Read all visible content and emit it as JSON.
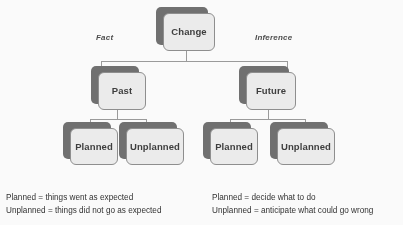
{
  "diagram": {
    "root": {
      "label": "Change"
    },
    "branch_tags": {
      "left": "Fact",
      "right": "Inference"
    },
    "level2": [
      {
        "label": "Past"
      },
      {
        "label": "Future"
      }
    ],
    "level3": [
      {
        "label": "Planned"
      },
      {
        "label": "Unplanned"
      },
      {
        "label": "Planned"
      },
      {
        "label": "Unplanned"
      }
    ],
    "colors": {
      "card_fill": "#ededed",
      "card_border": "#8d8d8d",
      "card_shadow": "#6e6e6e",
      "connector": "#9a9a9a",
      "text": "#3b3b3b",
      "background": "#fdfdfd"
    }
  },
  "legends": {
    "left": {
      "line1": "Planned = things went as expected",
      "line2": "Unplanned = things did not go as expected"
    },
    "right": {
      "line1": "Planned = decide what to do",
      "line2": "Unplanned = anticipate what could go wrong"
    }
  }
}
